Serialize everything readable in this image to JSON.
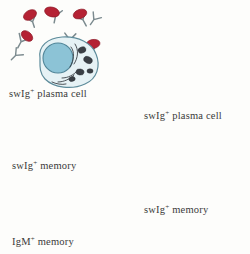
{
  "figure": {
    "background_color": "#fdfdfb"
  },
  "labels": {
    "left_plasma_cell": "swIg",
    "left_plasma_cell_sup": "+",
    "left_plasma_cell_rest": " plasma cell",
    "left_memory_cell": "swIg",
    "left_memory_cell_sup": "+",
    "left_memory_cell_rest": " memory",
    "left_igm_memory": "IgM",
    "left_igm_memory_sup": "+",
    "left_igm_memory_rest": " memory",
    "right_plasma_cell": "swIg",
    "right_plasma_cell_sup": "+",
    "right_plasma_cell_rest": " plasma cell",
    "right_memory_cell": "swIg",
    "right_memory_cell_sup": "+",
    "right_memory_cell_rest": " memory"
  },
  "colors": {
    "antigen_red": "#b52234",
    "antigen_red_dark": "#8e1a28",
    "antibody_grey": "#7b8a8e",
    "cell_membrane": "#cfe3e8",
    "cell_membrane_stroke": "#6f9aa8",
    "nucleus_blue": "#8cc3d6",
    "nucleus_blue_stroke": "#4f8497",
    "igm_green": "#7fb04a",
    "igm_green_light": "#a9cf7e",
    "igm_membrane": "#dcead0",
    "organelle_dark": "#3a3f45",
    "arrow": "#4a4a4a",
    "text": "#3a3a3a"
  },
  "cells": [
    {
      "name": "swIg-plus-plasma-cell-left",
      "type": "plasma",
      "color": "blue",
      "cx": 62,
      "cy": 60,
      "label": "swIg+ plasma cell",
      "secreting": true,
      "antigen_bound": true
    },
    {
      "name": "swIg-plus-memory-cell-left",
      "type": "memory",
      "color": "blue",
      "cx": 57,
      "cy": 131,
      "label": "swIg+ memory",
      "receptor": true,
      "antigen_bound": true
    },
    {
      "name": "igm-plus-memory-cell-left",
      "type": "memory",
      "color": "green",
      "cx": 57,
      "cy": 210,
      "label": "IgM+ memory",
      "receptor": true,
      "antigen_bound": false
    },
    {
      "name": "swIg-plus-plasma-cell-right",
      "type": "plasma",
      "color": "blue",
      "cx": 190,
      "cy": 80,
      "label": "swIg+ plasma cell",
      "secreting": true,
      "antigen_bound": false
    },
    {
      "name": "swIg-plus-memory-cell-right",
      "type": "memory",
      "color": "blue",
      "cx": 180,
      "cy": 180,
      "label": "swIg+ memory",
      "receptor": true,
      "antigen_bound": false
    }
  ],
  "arrows": [
    {
      "name": "arrow-to-plasma-cell",
      "from": [
        103,
        152
      ],
      "to": [
        152,
        106
      ],
      "direction": "up-right"
    },
    {
      "name": "arrow-to-memory-cell",
      "from": [
        103,
        153
      ],
      "to": [
        148,
        190
      ],
      "direction": "down-right"
    }
  ],
  "antibody_clusters": {
    "left_with_antigen": [
      {
        "x": 30,
        "y": 18,
        "rot": -15,
        "antigen": true
      },
      {
        "x": 52,
        "y": 12,
        "rot": 10,
        "antigen": true
      },
      {
        "x": 75,
        "y": 16,
        "rot": -25,
        "antigen": true
      },
      {
        "x": 20,
        "y": 36,
        "rot": 25,
        "antigen": true
      },
      {
        "x": 70,
        "y": 34,
        "rot": 5,
        "antigen": false
      },
      {
        "x": 92,
        "y": 44,
        "rot": -10,
        "antigen": true
      },
      {
        "x": 16,
        "y": 50,
        "rot": 40,
        "antigen": false
      },
      {
        "x": 96,
        "y": 20,
        "rot": 30,
        "antigen": false
      }
    ],
    "right_no_antigen": [
      {
        "x": 160,
        "y": 28,
        "rot": -12
      },
      {
        "x": 183,
        "y": 24,
        "rot": 18
      },
      {
        "x": 205,
        "y": 22,
        "rot": -5
      },
      {
        "x": 226,
        "y": 28,
        "rot": 25
      },
      {
        "x": 146,
        "y": 44,
        "rot": 30
      },
      {
        "x": 168,
        "y": 44,
        "rot": -20
      },
      {
        "x": 190,
        "y": 48,
        "rot": 8
      },
      {
        "x": 212,
        "y": 42,
        "rot": -28
      },
      {
        "x": 234,
        "y": 46,
        "rot": 15
      },
      {
        "x": 140,
        "y": 62,
        "rot": -18
      },
      {
        "x": 160,
        "y": 64,
        "rot": 22
      },
      {
        "x": 226,
        "y": 64,
        "rot": -8
      },
      {
        "x": 240,
        "y": 72,
        "rot": 35
      },
      {
        "x": 136,
        "y": 80,
        "rot": 12
      },
      {
        "x": 152,
        "y": 84,
        "rot": -30
      },
      {
        "x": 232,
        "y": 86,
        "rot": 5
      },
      {
        "x": 134,
        "y": 98,
        "rot": 28
      }
    ]
  }
}
